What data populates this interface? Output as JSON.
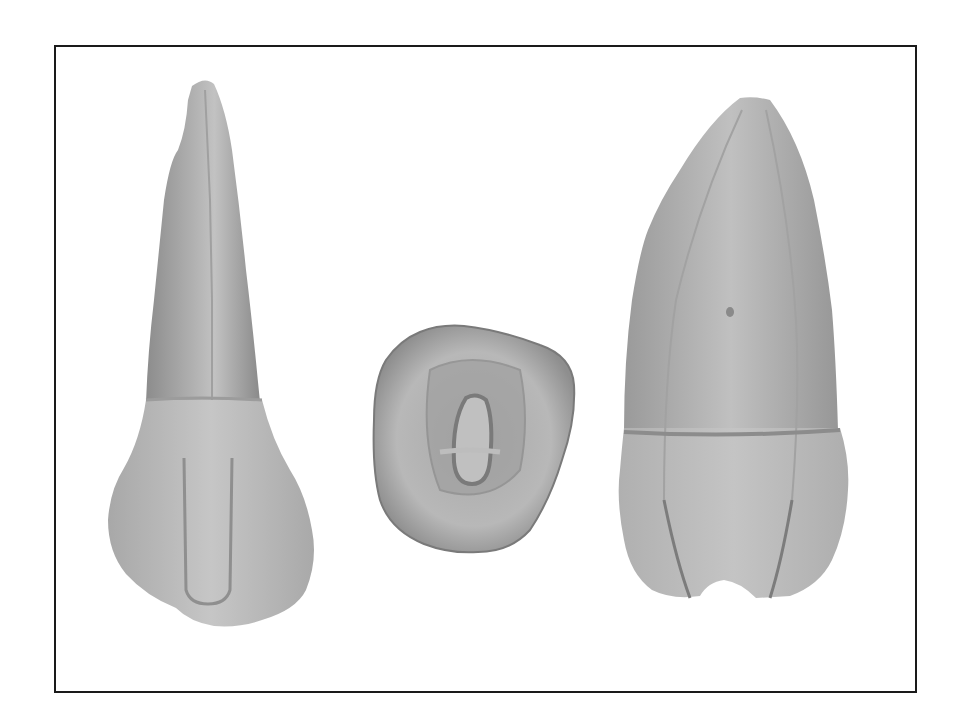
{
  "figure": {
    "views": [
      {
        "name": "lingual-view",
        "position": "left"
      },
      {
        "name": "occlusal-view",
        "position": "center"
      },
      {
        "name": "proximal-view",
        "position": "right"
      }
    ],
    "colors": {
      "frame_border": "#1a1a1a",
      "background": "#ffffff",
      "tooth_dark": "#8a8a8a",
      "tooth_mid": "#a8a8a8",
      "tooth_light": "#c8c8c8"
    }
  }
}
